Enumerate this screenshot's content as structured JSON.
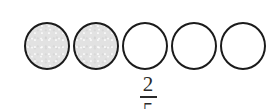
{
  "canvas": {
    "width": 277,
    "height": 110,
    "background_color": "#ffffff"
  },
  "style": {
    "outline_color": "#1b1b1b",
    "shaded_fill_color": "#e2e2e2",
    "unshaded_fill_color": "#ffffff",
    "text_color": "#2a2a2a"
  },
  "diagram": {
    "name": "fraction-circles-model",
    "shape": "circle",
    "total_parts": 5,
    "shaded_parts": 2,
    "parts": [
      {
        "index": 1,
        "state": "shaded",
        "fill": "#e2e2e2"
      },
      {
        "index": 2,
        "state": "shaded",
        "fill": "#e2e2e2"
      },
      {
        "index": 3,
        "state": "unshaded",
        "fill": "#ffffff"
      },
      {
        "index": 4,
        "state": "unshaded",
        "fill": "#ffffff"
      },
      {
        "index": 5,
        "state": "unshaded",
        "fill": "#ffffff"
      }
    ]
  },
  "fraction": {
    "numerator": "2",
    "denominator": "5",
    "clipped_at_bottom": true
  }
}
